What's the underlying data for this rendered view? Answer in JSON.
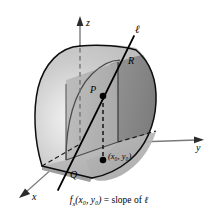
{
  "figure": {
    "type": "math-diagram-3d",
    "colors": {
      "surface_light": "#c9c9c9",
      "surface_highlight": "#f2f2f2",
      "surface_dark": "#8e8e8e",
      "cut_plane": "#b4b4b4",
      "cut_plane_shadow": "#a0a0a0",
      "base_wedge": "#b8b8b8",
      "stroke": "#000000",
      "axis": "#6e6e6e",
      "background": "#ffffff"
    },
    "axes": [
      {
        "id": "z",
        "label": "z",
        "direction": "up"
      },
      {
        "id": "y",
        "label": "y",
        "direction": "right"
      },
      {
        "id": "x",
        "label": "x",
        "direction": "lower-left"
      }
    ],
    "labels": {
      "z_axis": "z",
      "y_axis": "y",
      "x_axis": "x",
      "line": "ℓ",
      "point_p": "P",
      "point_q": "Q",
      "point_r": "R",
      "point_base": "(x₀, y₀)"
    },
    "points": [
      {
        "name": "P",
        "label": "P",
        "role": "point-on-surface",
        "filled": true
      },
      {
        "name": "base-point",
        "label": "(x₀, y₀)",
        "role": "point-in-xy-plane",
        "filled": true
      },
      {
        "name": "Q",
        "label": "Q",
        "role": "trace-corner-front",
        "filled": false
      },
      {
        "name": "R",
        "label": "R",
        "role": "trace-corner-back",
        "filled": false
      }
    ],
    "caption": {
      "func": "f",
      "func_sub": "x",
      "args": "(x₀, y₀)",
      "equals": "=",
      "rhs": "slope of",
      "line_symbol": "ℓ",
      "full_text": "fₓ(x₀, y₀) = slope of ℓ"
    }
  }
}
